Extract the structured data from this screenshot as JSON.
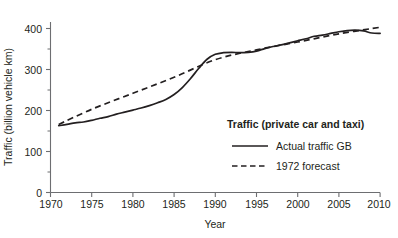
{
  "chart_data": {
    "type": "line",
    "title": "",
    "xlabel": "Year",
    "ylabel": "Traffic (billion vehicle km)",
    "xlim": [
      1970,
      2010
    ],
    "ylim": [
      0,
      440
    ],
    "grid": false,
    "legend_position": "inside-bottom-right",
    "legend_title": "Traffic (private car and taxi)",
    "x_ticks": [
      1970,
      1975,
      1980,
      1985,
      1990,
      1995,
      2000,
      2005,
      2010
    ],
    "x_tick_labels": [
      "1970",
      "1975",
      "1980",
      "1985",
      "1990",
      "1995",
      "2000",
      "2005",
      "2010"
    ],
    "y_ticks": [
      0,
      100,
      200,
      300,
      400
    ],
    "y_tick_labels": [
      "0",
      "100",
      "200",
      "300",
      "400"
    ],
    "y_minor_ticks": [
      50,
      150,
      250,
      350,
      430
    ],
    "series": [
      {
        "name": "Actual traffic GB",
        "style": "solid",
        "color": "#231f20",
        "x": [
          1971,
          1972,
          1973,
          1974,
          1975,
          1976,
          1977,
          1978,
          1979,
          1980,
          1981,
          1982,
          1983,
          1984,
          1985,
          1986,
          1987,
          1988,
          1989,
          1990,
          1991,
          1992,
          1993,
          1994,
          1995,
          1996,
          1997,
          1998,
          1999,
          2000,
          2001,
          2002,
          2003,
          2004,
          2005,
          2006,
          2007,
          2008,
          2009,
          2010
        ],
        "values": [
          163,
          166,
          170,
          172,
          176,
          181,
          185,
          191,
          196,
          201,
          206,
          212,
          219,
          227,
          239,
          256,
          278,
          303,
          325,
          337,
          341,
          342,
          341,
          342,
          345,
          351,
          356,
          360,
          365,
          370,
          375,
          381,
          384,
          388,
          392,
          395,
          396,
          394,
          389,
          388
        ]
      },
      {
        "name": "1972 forecast",
        "style": "dashed",
        "color": "#231f20",
        "x": [
          1971,
          1975,
          1980,
          1985,
          1990,
          1995,
          2000,
          2005,
          2010
        ],
        "values": [
          166,
          203,
          242,
          281,
          324,
          348,
          367,
          387,
          403
        ]
      }
    ]
  },
  "axis": {
    "y_title": "Traffic (billion vehicle km)",
    "x_title": "Year"
  },
  "legend": {
    "title": "Traffic (private car and taxi)",
    "entries": [
      {
        "label": "Actual traffic GB",
        "style": "solid"
      },
      {
        "label": "1972 forecast",
        "style": "dashed"
      }
    ]
  },
  "colors": {
    "line": "#231f20",
    "axis": "#6d6e71",
    "background": "#ffffff"
  }
}
